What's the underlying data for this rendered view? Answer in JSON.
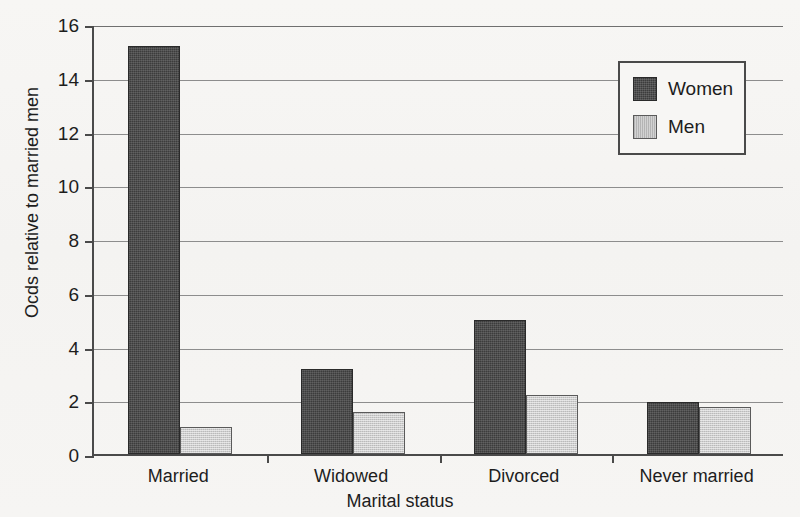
{
  "chart_data": {
    "type": "bar",
    "title": "",
    "xlabel": "Marital status",
    "ylabel": "Ocds relative to married men",
    "categories": [
      "Married",
      "Widowed",
      "Divorced",
      "Never married"
    ],
    "series": [
      {
        "name": "Women",
        "color": "#3c3c3c",
        "values": [
          15.2,
          3.15,
          5.0,
          1.95
        ]
      },
      {
        "name": "Men",
        "color": "#cdcdcd",
        "values": [
          1.0,
          1.55,
          2.2,
          1.75
        ]
      }
    ],
    "ylim": [
      0,
      16
    ],
    "yticks": [
      0,
      2,
      4,
      6,
      8,
      10,
      12,
      14,
      16
    ],
    "ytick_labels": [
      "0",
      "2",
      "4",
      "6",
      "8",
      "10",
      "12",
      "14",
      "16"
    ],
    "grid": true,
    "grid_axis": "y",
    "legend_position": "top-right",
    "bar_style": "grouped"
  },
  "legend": {
    "entries": [
      {
        "label": "Women",
        "swatch": "women-swatch"
      },
      {
        "label": "Men",
        "swatch": "men-swatch"
      }
    ]
  }
}
